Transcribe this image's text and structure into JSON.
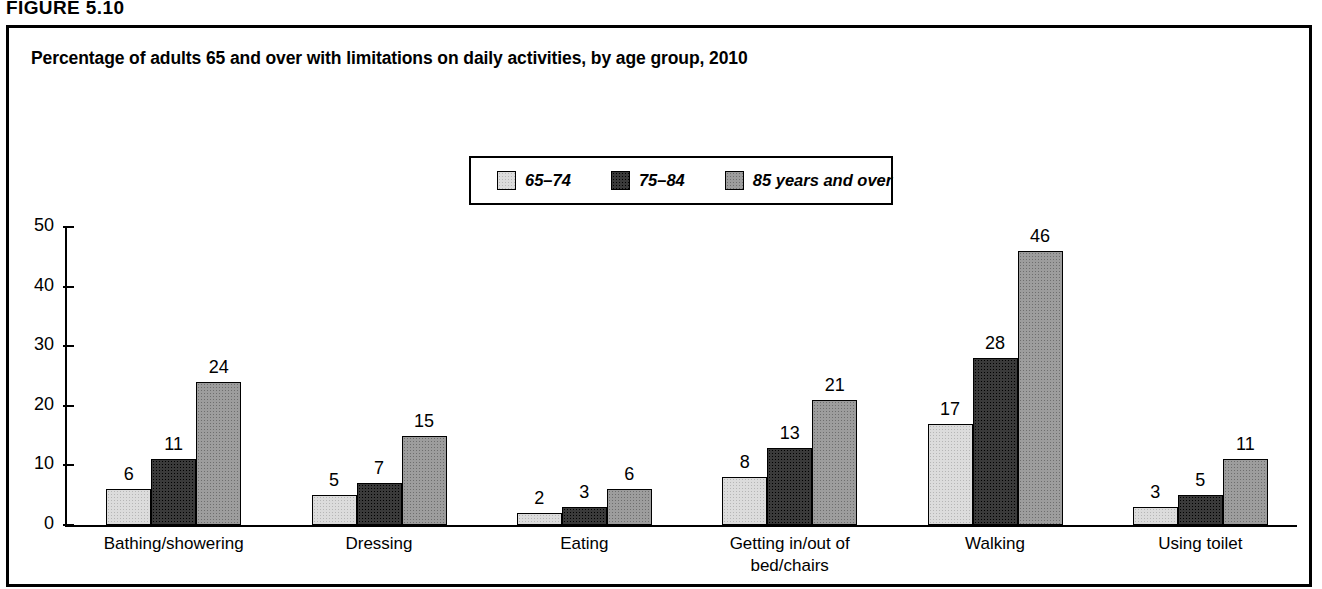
{
  "figure": {
    "header": "FIGURE 5.10"
  },
  "chart_data": {
    "type": "bar",
    "title": "Percentage of adults 65 and over with limitations on daily activities, by age group, 2010",
    "xlabel": "",
    "ylabel": "",
    "ylim": [
      0,
      50
    ],
    "yticks": [
      0,
      10,
      20,
      30,
      40,
      50
    ],
    "ytick_labels": [
      "0",
      "10",
      "20",
      "30",
      "40",
      "50"
    ],
    "grid": false,
    "legend_position": "top-center",
    "categories": [
      "Bathing/showering",
      "Dressing",
      "Eating",
      "Getting in/out of\nbed/chairs",
      "Walking",
      "Using toilet"
    ],
    "series": [
      {
        "name": "65–74",
        "color": "#dcdcdc",
        "values": [
          6,
          5,
          2,
          8,
          17,
          3
        ],
        "labels": [
          "6",
          "5",
          "2",
          "8",
          "17",
          "3"
        ]
      },
      {
        "name": "75–84",
        "color": "#3a3a3a",
        "values": [
          11,
          7,
          3,
          13,
          28,
          5
        ],
        "labels": [
          "11",
          "7",
          "3",
          "13",
          "28",
          "5"
        ]
      },
      {
        "name": "85 years and over",
        "color": "#9d9d9d",
        "values": [
          24,
          15,
          6,
          21,
          46,
          11
        ],
        "labels": [
          "24",
          "15",
          "6",
          "21",
          "46",
          "11"
        ]
      }
    ]
  }
}
